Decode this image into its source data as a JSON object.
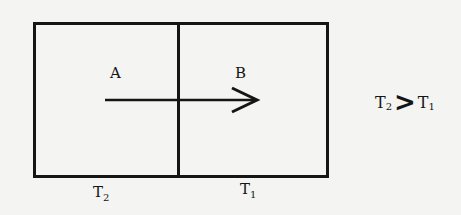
{
  "diagram": {
    "regions": [
      {
        "id": "A",
        "label": "A",
        "temperature": {
          "symbol": "T",
          "subscript": "2"
        }
      },
      {
        "id": "B",
        "label": "B",
        "temperature": {
          "symbol": "T",
          "subscript": "1"
        }
      }
    ],
    "arrow": {
      "from": "A",
      "to": "B",
      "direction": "right"
    },
    "relation": {
      "left": {
        "symbol": "T",
        "subscript": "2"
      },
      "operator": ">",
      "right": {
        "symbol": "T",
        "subscript": "1"
      }
    },
    "colors": {
      "stroke": "#151515",
      "background": "#f4f4f2"
    }
  }
}
